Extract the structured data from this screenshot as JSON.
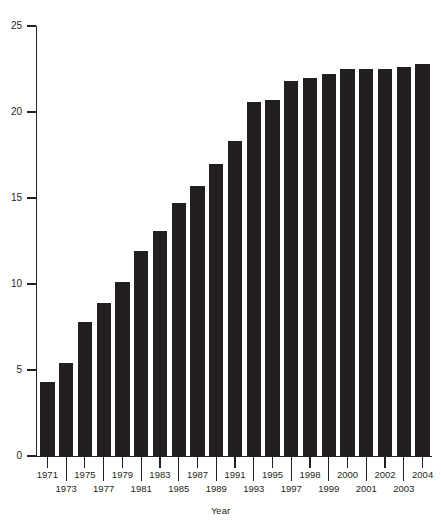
{
  "top_sliver_text": "",
  "chart_data": {
    "type": "bar",
    "title": "",
    "xlabel": "Year",
    "ylabel": "",
    "ylim": [
      0,
      25
    ],
    "yticks": [
      0,
      5,
      10,
      15,
      20,
      25
    ],
    "grid": false,
    "legend": null,
    "bar_color": "#231f20",
    "axis_color": "#231f20",
    "background_color": "#ffffff",
    "categories": [
      "1971",
      "1973",
      "1975",
      "1977",
      "1979",
      "1981",
      "1983",
      "1985",
      "1987",
      "1989",
      "1991",
      "1993",
      "1995",
      "1997",
      "1998",
      "1999",
      "2000",
      "2001",
      "2002",
      "2003",
      "2004"
    ],
    "values": [
      4.3,
      5.4,
      7.8,
      8.9,
      10.1,
      11.9,
      13.1,
      14.7,
      15.7,
      17.0,
      18.3,
      20.6,
      20.7,
      21.8,
      22.0,
      22.2,
      22.5,
      22.5,
      22.5,
      22.6,
      22.8
    ],
    "tick_labels_upper_row": [
      "1971",
      "1975",
      "1979",
      "1983",
      "1987",
      "1991",
      "1995",
      "1998",
      "2000",
      "2002",
      "2004"
    ],
    "tick_labels_lower_row": [
      "1973",
      "1977",
      "1981",
      "1985",
      "1989",
      "1993",
      "1997",
      "1999",
      "2001",
      "2003"
    ]
  }
}
